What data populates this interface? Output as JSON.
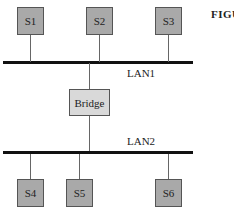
{
  "figure": {
    "caption_fragment": "FIGU",
    "lans": [
      {
        "id": "lan1",
        "label": "LAN1"
      },
      {
        "id": "lan2",
        "label": "LAN2"
      }
    ],
    "bridge": {
      "label": "Bridge"
    },
    "stations": [
      {
        "id": "s1",
        "label": "S1",
        "lan": "LAN1"
      },
      {
        "id": "s2",
        "label": "S2",
        "lan": "LAN1"
      },
      {
        "id": "s3",
        "label": "S3",
        "lan": "LAN1"
      },
      {
        "id": "s4",
        "label": "S4",
        "lan": "LAN2"
      },
      {
        "id": "s5",
        "label": "S5",
        "lan": "LAN2"
      },
      {
        "id": "s6",
        "label": "S6",
        "lan": "LAN2"
      }
    ],
    "colors": {
      "station_fill": "#a9a9a9",
      "bridge_fill": "#d9d9d9",
      "bus_line": "#111111",
      "connector": "#666666"
    }
  }
}
